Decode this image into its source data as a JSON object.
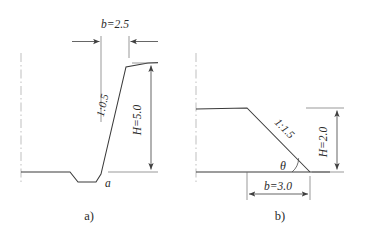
{
  "figure": {
    "title": "",
    "background_color": "#ffffff",
    "line_color": "#3a3a3a",
    "dimension_color": "#4a4a4a",
    "centerline_color": "#b4b4b4"
  },
  "panels": [
    {
      "id": "a",
      "caption": "a)",
      "description": "Steep embankment slope with toe ditch",
      "labels": {
        "crest_width": {
          "symbol": "b",
          "equals": "=",
          "value": "2.5",
          "full": "b=2.5"
        },
        "slope_ratio": {
          "full": "1:0.5"
        },
        "height": {
          "symbol": "H",
          "equals": "=",
          "value": "5.0",
          "full": "H=5.0"
        },
        "toe_point": {
          "full": "a"
        }
      }
    },
    {
      "id": "b",
      "caption": "b)",
      "description": "Cut slope descending to ground with base angle theta",
      "labels": {
        "base_width": {
          "symbol": "b",
          "equals": "=",
          "value": "3.0",
          "full": "b=3.0"
        },
        "slope_ratio": {
          "full": "1:1.5"
        },
        "height": {
          "symbol": "H",
          "equals": "=",
          "value": "2.0",
          "full": "H=2.0"
        },
        "base_angle": {
          "full": "θ"
        }
      }
    }
  ]
}
